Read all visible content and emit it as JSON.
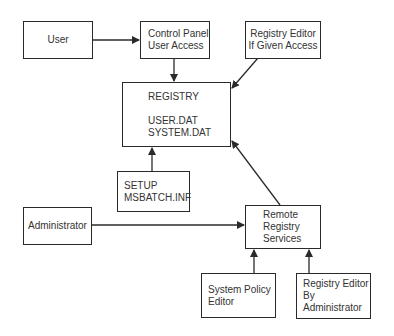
{
  "diagram": {
    "nodes": {
      "user": {
        "lines": [
          "User"
        ]
      },
      "control_panel": {
        "lines": [
          "Control Panel",
          "User Access"
        ]
      },
      "registry_editor_given": {
        "lines": [
          "Registry Editor",
          "If Given Access"
        ]
      },
      "registry": {
        "title": "REGISTRY",
        "lines": [
          "USER.DAT",
          "SYSTEM.DAT"
        ]
      },
      "setup": {
        "lines": [
          "SETUP",
          "MSBATCH.INF"
        ]
      },
      "administrator": {
        "lines": [
          "Administrator"
        ]
      },
      "remote_registry": {
        "lines": [
          "Remote",
          "Registry",
          "Services"
        ]
      },
      "system_policy_editor": {
        "lines": [
          "System Policy",
          "Editor"
        ]
      },
      "registry_editor_admin": {
        "lines": [
          "Registry Editor",
          "By",
          "Administrator"
        ]
      }
    },
    "edges": [
      {
        "from": "User",
        "to": "Control Panel User Access"
      },
      {
        "from": "Control Panel User Access",
        "to": "REGISTRY"
      },
      {
        "from": "Registry Editor If Given Access",
        "to": "REGISTRY"
      },
      {
        "from": "SETUP MSBATCH.INF",
        "to": "REGISTRY"
      },
      {
        "from": "Remote Registry Services",
        "to": "REGISTRY"
      },
      {
        "from": "Administrator",
        "to": "Remote Registry Services"
      },
      {
        "from": "System Policy Editor",
        "to": "Remote Registry Services"
      },
      {
        "from": "Registry Editor By Administrator",
        "to": "Remote Registry Services"
      }
    ],
    "colors": {
      "line": "#2a2a2a",
      "text": "#333333",
      "background": "#ffffff"
    }
  }
}
